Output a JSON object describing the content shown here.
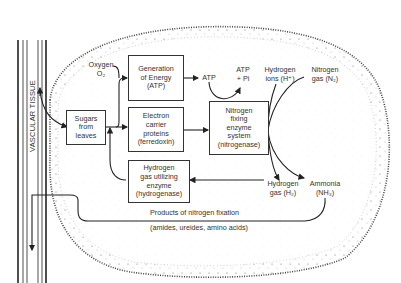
{
  "diagram": {
    "vascular_tissue_label": "VASCULAR TISSUE",
    "boxes": {
      "sugars": "Sugars\nfrom\nleaves",
      "energy": "Generation\nof Energy\n(ATP)",
      "electron": "Electron\ncarrier\nproteins\n(ferredoxin)",
      "nitrogenase": "Nitrogen\nfixing\nenzyme\nsystem\n(nitrogenase)",
      "hydrogenase": "Hydrogen\ngas utilizing\nenzyme\n(hydrogenase)"
    },
    "labels": {
      "oxygen": "Oxygen\nO₂",
      "atp": "ATP",
      "atp_pi": "ATP\n+ Pi",
      "hydrogen_ions": "Hydrogen\nions (H⁺)",
      "nitrogen_gas": "Nitrogen\ngas (N₂)",
      "hydrogen_gas": "Hydrogen\ngas (H₂)",
      "ammonia": "Ammonia\n(NH₃)",
      "products": "Products of nitrogen fixation",
      "products_detail": "(amides, ureides, amino acids)"
    },
    "edges": [
      {
        "from": "vascular tissue",
        "to": "Sugars from leaves"
      },
      {
        "from": "Sugars from leaves",
        "to": "Generation of Energy (ATP)"
      },
      {
        "from": "Oxygen O₂",
        "to": "Generation of Energy (ATP)"
      },
      {
        "from": "Sugars from leaves",
        "to": "Electron carrier proteins (ferredoxin)"
      },
      {
        "from": "Generation of Energy (ATP)",
        "to": "ATP"
      },
      {
        "from": "ATP",
        "to": "ATP + Pi",
        "via": "Nitrogen fixing enzyme system"
      },
      {
        "from": "Electron carrier proteins (ferredoxin)",
        "to": "Nitrogen fixing enzyme system (nitrogenase)"
      },
      {
        "from": "Hydrogen ions (H⁺)",
        "to": "Nitrogen fixing enzyme system (nitrogenase)"
      },
      {
        "from": "Nitrogen gas (N₂)",
        "to": "Nitrogen fixing enzyme system (nitrogenase)"
      },
      {
        "from": "Nitrogen fixing enzyme system (nitrogenase)",
        "to": "Hydrogen gas (H₂)"
      },
      {
        "from": "Nitrogen fixing enzyme system (nitrogenase)",
        "to": "Ammonia (NH₃)"
      },
      {
        "from": "Hydrogen gas (H₂)",
        "to": "Hydrogen gas utilizing enzyme (hydrogenase)"
      },
      {
        "from": "Hydrogen gas utilizing enzyme (hydrogenase)",
        "to": "Electron carrier proteins (ferredoxin)"
      },
      {
        "from": "Ammonia (NH₃)",
        "to": "vascular tissue",
        "label": "Products of nitrogen fixation"
      }
    ]
  }
}
